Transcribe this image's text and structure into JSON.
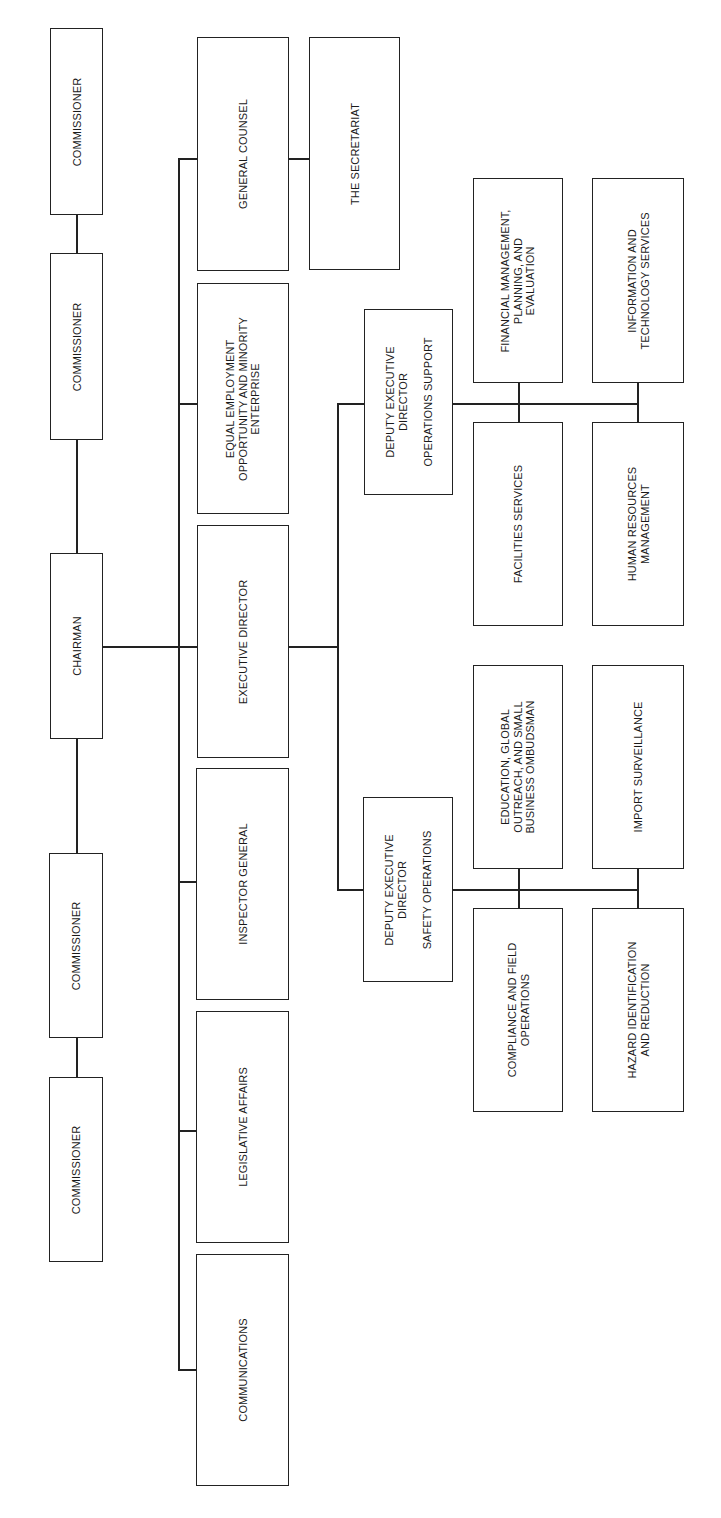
{
  "chart_title": "",
  "nodes": {
    "commissioner_1": "COMMISSIONER",
    "commissioner_2": "COMMISSIONER",
    "chairman": "CHAIRMAN",
    "commissioner_3": "COMMISSIONER",
    "commissioner_4": "COMMISSIONER",
    "general_counsel": "GENERAL COUNSEL",
    "secretariat": "THE SECRETARIAT",
    "eeo": "EQUAL EMPLOYMENT\nOPPORTUNITY AND MINORITY\nENTERPRISE",
    "executive_director": "EXECUTIVE DIRECTOR",
    "inspector_general": "INSPECTOR GENERAL",
    "legislative_affairs": "LEGISLATIVE AFFAIRS",
    "communications": "COMMUNICATIONS",
    "deputy_ops_support": "DEPUTY EXECUTIVE\nDIRECTOR\n\nOPERATIONS SUPPORT",
    "financial_mgmt": "FINANCIAL MANAGEMENT,\nPLANNING, AND\nEVALUATION",
    "info_tech": "INFORMATION AND\nTECHNOLOGY SERVICES",
    "facilities": "FACILITIES SERVICES",
    "human_resources": "HUMAN RESOURCES\nMANAGEMENT",
    "deputy_safety_ops": "DEPUTY EXECUTIVE\nDIRECTOR\n\nSAFETY OPERATIONS",
    "education_outreach": "EDUCATION, GLOBAL\nOUTREACH, AND SMALL\nBUSINESS OMBUDSMAN",
    "import_surveillance": "IMPORT SURVEILLANCE",
    "compliance": "COMPLIANCE AND FIELD\nOPERATIONS",
    "hazard": "HAZARD IDENTIFICATION\nAND REDUCTION"
  },
  "hierarchy": {
    "chairman": [
      "commissioner_1",
      "commissioner_2",
      "commissioner_3",
      "commissioner_4",
      "general_counsel",
      "eeo",
      "executive_director",
      "inspector_general",
      "legislative_affairs",
      "communications"
    ],
    "general_counsel": [
      "secretariat"
    ],
    "executive_director": [
      "deputy_ops_support",
      "deputy_safety_ops"
    ],
    "deputy_ops_support": [
      "financial_mgmt",
      "info_tech",
      "facilities",
      "human_resources"
    ],
    "deputy_safety_ops": [
      "education_outreach",
      "import_surveillance",
      "compliance",
      "hazard"
    ]
  },
  "orientation": "rotated 90deg counter-clockwise"
}
